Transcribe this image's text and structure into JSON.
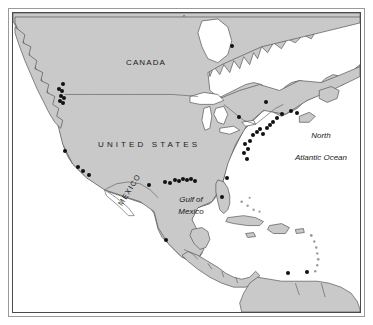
{
  "figure": {
    "kind": "map",
    "region": "North America",
    "projection_note": "North America, Central America, Caribbean and northern South America",
    "frame": {
      "outer_color": "#9a9a9a",
      "inner_color": "#4a4a4a"
    }
  },
  "colors": {
    "land": "#c9c9c9",
    "land_stroke": "#555555",
    "water": "#ffffff",
    "lake": "#ffffff",
    "border_line": "#666666",
    "dot": "#111111",
    "label": "#1a1a1a",
    "page_background": "#ffffff"
  },
  "labels": {
    "canada": "CANADA",
    "united_states": "UNITED STATES",
    "mexico": "MEXICO",
    "gulf_line1": "Gulf of",
    "gulf_line2": "Mexico",
    "ocean_line1": "North",
    "ocean_line2": "Atlantic Ocean"
  },
  "map_data": {
    "type": "point-distribution-map",
    "marker_style": "filled black circle",
    "marker_count": 44,
    "markers": [
      {
        "region": "Pacific Northwest",
        "x": 62,
        "y": 83
      },
      {
        "region": "Pacific Northwest",
        "x": 58,
        "y": 88
      },
      {
        "region": "Pacific Northwest",
        "x": 61,
        "y": 90
      },
      {
        "region": "Pacific Northwest",
        "x": 60,
        "y": 95
      },
      {
        "region": "Pacific Northwest",
        "x": 63,
        "y": 97
      },
      {
        "region": "Pacific Northwest",
        "x": 59,
        "y": 100
      },
      {
        "region": "Pacific Northwest",
        "x": 62,
        "y": 102
      },
      {
        "region": "California",
        "x": 64,
        "y": 150
      },
      {
        "region": "California",
        "x": 77,
        "y": 166
      },
      {
        "region": "California",
        "x": 82,
        "y": 170
      },
      {
        "region": "California",
        "x": 88,
        "y": 174
      },
      {
        "region": "Gulf Coast",
        "x": 148,
        "y": 184
      },
      {
        "region": "Gulf Coast",
        "x": 164,
        "y": 181
      },
      {
        "region": "Gulf Coast",
        "x": 169,
        "y": 182
      },
      {
        "region": "Gulf Coast",
        "x": 174,
        "y": 179
      },
      {
        "region": "Gulf Coast",
        "x": 178,
        "y": 180
      },
      {
        "region": "Gulf Coast",
        "x": 182,
        "y": 178
      },
      {
        "region": "Gulf Coast",
        "x": 186,
        "y": 179
      },
      {
        "region": "Gulf Coast",
        "x": 190,
        "y": 178
      },
      {
        "region": "Gulf Coast",
        "x": 194,
        "y": 180
      },
      {
        "region": "Florida",
        "x": 221,
        "y": 196
      },
      {
        "region": "Southeast Atlantic",
        "x": 226,
        "y": 177
      },
      {
        "region": "Mid Atlantic",
        "x": 246,
        "y": 158
      },
      {
        "region": "Mid Atlantic",
        "x": 243,
        "y": 152
      },
      {
        "region": "Mid Atlantic",
        "x": 247,
        "y": 148
      },
      {
        "region": "Mid Atlantic",
        "x": 244,
        "y": 143
      },
      {
        "region": "Mid Atlantic",
        "x": 249,
        "y": 140
      },
      {
        "region": "Northeast",
        "x": 252,
        "y": 134
      },
      {
        "region": "Northeast",
        "x": 256,
        "y": 131
      },
      {
        "region": "Northeast",
        "x": 259,
        "y": 128
      },
      {
        "region": "Northeast",
        "x": 262,
        "y": 133
      },
      {
        "region": "Northeast",
        "x": 266,
        "y": 127
      },
      {
        "region": "Northeast",
        "x": 269,
        "y": 124
      },
      {
        "region": "Northeast",
        "x": 272,
        "y": 121
      },
      {
        "region": "New England",
        "x": 276,
        "y": 117
      },
      {
        "region": "New England",
        "x": 281,
        "y": 113
      },
      {
        "region": "Canada Maritimes",
        "x": 290,
        "y": 110
      },
      {
        "region": "Canada Maritimes",
        "x": 296,
        "y": 112
      },
      {
        "region": "St Lawrence",
        "x": 265,
        "y": 101
      },
      {
        "region": "Great Lakes",
        "x": 238,
        "y": 116
      },
      {
        "region": "Hudson Bay",
        "x": 231,
        "y": 45
      },
      {
        "region": "Gulf of Mexico (Veracruz)",
        "x": 165,
        "y": 239
      },
      {
        "region": "Caribbean South America",
        "x": 287,
        "y": 272
      },
      {
        "region": "Caribbean South America",
        "x": 306,
        "y": 271
      }
    ],
    "label_positions": [
      {
        "text": "CANADA",
        "x": 137,
        "y": 58,
        "style": "uppercase"
      },
      {
        "text": "UNITED STATES",
        "x": 161,
        "y": 143,
        "style": "uppercase-wide"
      },
      {
        "text": "MEXICO",
        "x": 132,
        "y": 213,
        "style": "uppercase-rotated"
      },
      {
        "text": "Gulf of Mexico",
        "x": 186,
        "y": 203,
        "style": "italic"
      },
      {
        "text": "North Atlantic Ocean",
        "x": 311,
        "y": 142,
        "style": "italic"
      }
    ]
  }
}
